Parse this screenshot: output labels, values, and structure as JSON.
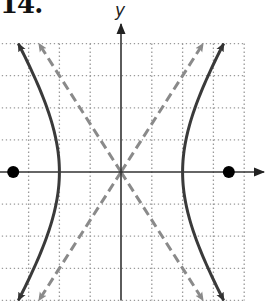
{
  "problem": {
    "number": "14."
  },
  "axes": {
    "x_label": "",
    "y_label": "y"
  },
  "colors": {
    "hyperbola": "#3a3a3a",
    "asymptote": "#8a8a8a",
    "axis": "#333333",
    "grid": "#9a9a9a",
    "focus": "#000000"
  },
  "graph": {
    "origin_px": [
      121,
      172
    ],
    "unit_px_x": 30.8,
    "unit_px_y": 32.1,
    "grid_range": {
      "x": [
        -4,
        4
      ],
      "y": [
        -4,
        4
      ]
    },
    "hyperbola": {
      "equation": "x^2/4 - y^2/9 = 1",
      "a": 2,
      "b": 3,
      "vertices": [
        [
          -2,
          0
        ],
        [
          2,
          0
        ]
      ]
    },
    "asymptotes": [
      "y = 1.5x",
      "y = -1.5x"
    ],
    "foci": [
      [
        -3.5,
        0
      ],
      [
        3.5,
        0
      ]
    ]
  }
}
